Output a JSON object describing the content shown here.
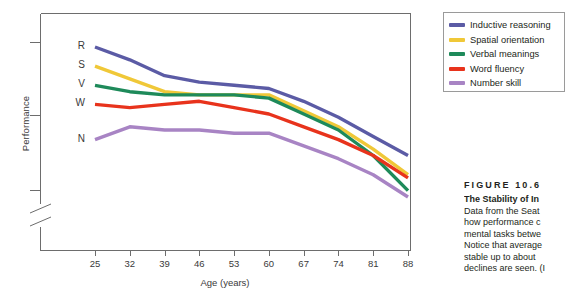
{
  "chart_data": {
    "type": "line",
    "title": "",
    "xlabel": "Age (years)",
    "ylabel": "Performance",
    "categories": [
      25,
      32,
      39,
      46,
      53,
      60,
      67,
      74,
      81,
      88
    ],
    "xlim": [
      21.5,
      91.5
    ],
    "grid": false,
    "axis_break": true,
    "legend_position": "top-right-outside",
    "series": [
      {
        "name": "Inductive reasoning",
        "letter": "R",
        "color": "#5b5ba5",
        "values": [
          47,
          43,
          38,
          36,
          35,
          34,
          30,
          25,
          19,
          13
        ]
      },
      {
        "name": "Spatial orientation",
        "letter": "S",
        "color": "#f0c838",
        "values": [
          41,
          37,
          33,
          32,
          32,
          32,
          27,
          22,
          15,
          7
        ]
      },
      {
        "name": "Verbal meanings",
        "letter": "V",
        "color": "#1e8a5a",
        "values": [
          35,
          33,
          32,
          32,
          32,
          31,
          26,
          21,
          13,
          2
        ]
      },
      {
        "name": "Word fluency",
        "letter": "W",
        "color": "#e8331c",
        "values": [
          29,
          28,
          29,
          30,
          28,
          26,
          22,
          18,
          13,
          6
        ]
      },
      {
        "name": "Number skill",
        "letter": "N",
        "color": "#a884c4",
        "values": [
          18,
          22,
          21,
          21,
          20,
          20,
          16,
          12,
          7,
          0
        ]
      }
    ]
  },
  "axes": {
    "y_label": "Performance",
    "x_label": "Age (years)",
    "x_ticks": [
      "25",
      "32",
      "39",
      "46",
      "53",
      "60",
      "67",
      "74",
      "81",
      "88"
    ]
  },
  "legend": {
    "items": [
      {
        "label": "Inductive reasoning",
        "color": "#5b5ba5"
      },
      {
        "label": "Spatial orientation",
        "color": "#f0c838"
      },
      {
        "label": "Verbal meanings",
        "color": "#1e8a5a"
      },
      {
        "label": "Word fluency",
        "color": "#e8331c"
      },
      {
        "label": "Number skill",
        "color": "#a884c4"
      }
    ]
  },
  "caption": {
    "figure_number": "FIGURE 10.6",
    "title": "The Stability of In",
    "lines": [
      "Data from the Seat",
      "how performance c",
      "mental tasks betwe",
      "Notice that average",
      "stable up to about ",
      "declines are seen. (I"
    ]
  }
}
